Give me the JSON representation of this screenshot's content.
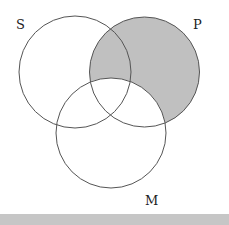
{
  "diagram": {
    "type": "venn",
    "sets": [
      {
        "label": "S",
        "cx": 75,
        "cy": 72,
        "r": 56
      },
      {
        "label": "P",
        "cx": 144.5,
        "cy": 72,
        "r": 55
      },
      {
        "label": "M",
        "cx": 111,
        "cy": 133,
        "r": 55
      }
    ],
    "shaded_region": "P minus M",
    "colors": {
      "stroke": "#555555",
      "shade": "#c0c0c0",
      "background": "#ffffff",
      "band": "#c6c6c6"
    }
  }
}
